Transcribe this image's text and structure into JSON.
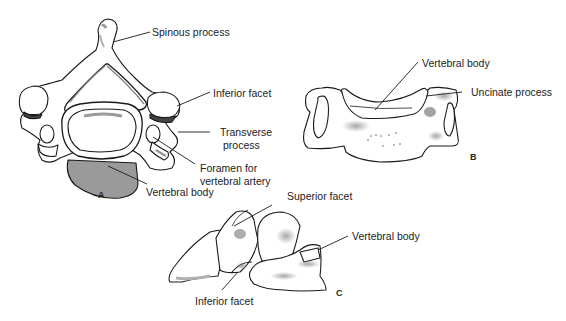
{
  "figure": {
    "views": [
      {
        "id": "A",
        "label": "A",
        "description": "Superior view"
      },
      {
        "id": "B",
        "label": "B",
        "description": "Anterior view"
      },
      {
        "id": "C",
        "label": "C",
        "description": "Lateral view"
      }
    ],
    "labels": {
      "a_spinous": "Spinous process",
      "a_inferior_facet": "Inferior facet",
      "a_transverse_1": "Transverse",
      "a_transverse_2": "process",
      "a_foramen_1": "Foramen for",
      "a_foramen_2": "vertebral artery",
      "a_body": "Vertebral body",
      "b_body": "Vertebral body",
      "b_uncinate": "Uncinate process",
      "c_superior_facet": "Superior facet",
      "c_body": "Vertebral body",
      "c_inferior_facet": "Inferior facet"
    },
    "colors": {
      "stroke": "#1a1a1a",
      "shade": "#8a8a8a",
      "dark_shade": "#555555",
      "fill": "#ffffff"
    }
  }
}
